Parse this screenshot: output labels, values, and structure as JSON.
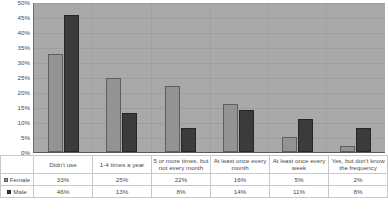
{
  "chart_data": {
    "type": "bar",
    "title": "",
    "xlabel": "",
    "ylabel": "",
    "ylim": [
      0,
      50
    ],
    "ytick_labels": [
      "50%",
      "45%",
      "40%",
      "35%",
      "30%",
      "25%",
      "20%",
      "15%",
      "10%",
      "5%",
      "0%"
    ],
    "ytick_values": [
      50,
      45,
      40,
      35,
      30,
      25,
      20,
      15,
      10,
      5,
      0
    ],
    "grid": true,
    "legend_position": "table-below",
    "categories": [
      "Didn't use",
      "1-4 times a year",
      "5 or more times, but not every month",
      "At least once every month",
      "At least once every week",
      "Yes, but don't know the frequency"
    ],
    "series": [
      {
        "name": "Female",
        "color": "#939393",
        "values": [
          33,
          25,
          22,
          16,
          5,
          2
        ],
        "labels": [
          "33%",
          "25%",
          "22%",
          "16%",
          "5%",
          "2%"
        ]
      },
      {
        "name": "Male",
        "color": "#3b3b3b",
        "values": [
          46,
          13,
          8,
          14,
          11,
          8
        ],
        "labels": [
          "46%",
          "13%",
          "8%",
          "14%",
          "11%",
          "8%"
        ]
      }
    ]
  },
  "colors": {
    "plot_background": "#a9a9a9",
    "female_bar": "#939393",
    "male_bar": "#3b3b3b",
    "page_background": "#ffffff",
    "grid": "#969696",
    "table_border": "#c9c9c9",
    "text": "#4a4a4a"
  }
}
